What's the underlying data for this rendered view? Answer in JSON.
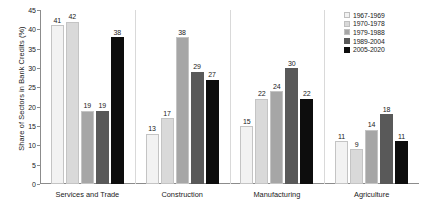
{
  "chart_data": {
    "type": "bar",
    "title": "",
    "subtitle": "",
    "xlabel": "",
    "ylabel": "Share of Sectors in Bank Credits (%)",
    "ylim": [
      0,
      45
    ],
    "yticks": [
      0,
      5,
      10,
      15,
      20,
      25,
      30,
      35,
      40,
      45
    ],
    "grid": false,
    "legend_position": "right",
    "categories": [
      "Services and Trade",
      "Construction",
      "Manufacturing",
      "Agriculture"
    ],
    "series": [
      {
        "name": "1967-1969",
        "color": "#f2f2f2",
        "values": [
          41,
          13,
          15,
          11
        ]
      },
      {
        "name": "1970-1978",
        "color": "#d9d9d9",
        "values": [
          42,
          17,
          22,
          9
        ]
      },
      {
        "name": "1979-1988",
        "color": "#a6a6a6",
        "values": [
          19,
          38,
          24,
          14
        ]
      },
      {
        "name": "1989-2004",
        "color": "#595959",
        "values": [
          19,
          29,
          30,
          18
        ]
      },
      {
        "name": "2005-2020",
        "color": "#0d0d0d",
        "values": [
          38,
          27,
          22,
          11
        ]
      }
    ]
  },
  "legend": {
    "items": [
      {
        "label": "1967-1969"
      },
      {
        "label": "1970-1978"
      },
      {
        "label": "1979-1988"
      },
      {
        "label": "1989-2004"
      },
      {
        "label": "2005-2020"
      }
    ]
  },
  "axis": {
    "y_title": "Share of Sectors in Bank Credits (%)"
  }
}
